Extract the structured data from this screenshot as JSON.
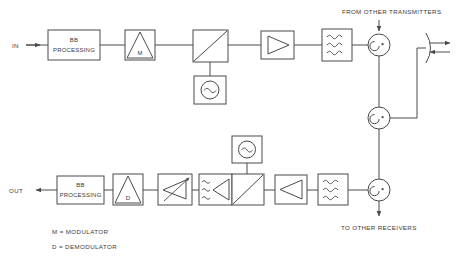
{
  "diagram": {
    "type": "block-diagram",
    "stroke_color": "#4a4a4a",
    "background_color": "#ffffff",
    "transmit_chain": {
      "input_label": "IN",
      "blocks": [
        {
          "id": "tx-bb",
          "label_line1": "BB",
          "label_line2": "PROCESSING",
          "symbol": "baseband-processing"
        },
        {
          "id": "tx-mod",
          "label": "M",
          "symbol": "modulator-triangle"
        },
        {
          "id": "tx-mixer",
          "label": "",
          "symbol": "mixer-diagonal"
        },
        {
          "id": "tx-amp",
          "label": "",
          "symbol": "amplifier-triangle-right"
        },
        {
          "id": "tx-filter",
          "label": "",
          "symbol": "filter-waves"
        }
      ],
      "oscillator": {
        "id": "tx-osc",
        "symbol": "oscillator-sine-circle"
      }
    },
    "receive_chain": {
      "output_label": "OUT",
      "blocks": [
        {
          "id": "rx-bb",
          "label_line1": "BB",
          "label_line2": "PROCESSING",
          "symbol": "baseband-processing"
        },
        {
          "id": "rx-demod",
          "label": "D",
          "symbol": "demodulator-triangle"
        },
        {
          "id": "rx-vga",
          "label": "",
          "symbol": "variable-gain-amplifier"
        },
        {
          "id": "rx-if-filter-amp",
          "label": "",
          "symbol": "filter-waves-amplifier"
        },
        {
          "id": "rx-mixer",
          "label": "",
          "symbol": "mixer-diagonal"
        },
        {
          "id": "rx-lna",
          "label": "",
          "symbol": "amplifier-triangle-left"
        },
        {
          "id": "rx-rf-filter",
          "label": "",
          "symbol": "filter-waves"
        }
      ],
      "oscillator": {
        "id": "rx-osc",
        "symbol": "oscillator-sine-circle"
      }
    },
    "circulators": [
      {
        "id": "circulator-top",
        "symbol": "circulator-arrow"
      },
      {
        "id": "circulator-middle",
        "symbol": "circulator-arrow"
      },
      {
        "id": "circulator-bottom",
        "symbol": "circulator-arrow"
      }
    ],
    "antenna": {
      "id": "antenna",
      "symbol": "antenna-dish",
      "arrows": [
        "transmit-right",
        "receive-left"
      ]
    },
    "annotations": {
      "from_other_transmitters": "FROM OTHER TRANSMITTERS",
      "to_other_receivers": "TO OTHER RECEIVERS"
    },
    "legend": [
      {
        "key": "M",
        "separator": "=",
        "text": "M = MODULATOR"
      },
      {
        "key": "D",
        "separator": "=",
        "text": "D = DEMODULATOR"
      }
    ]
  }
}
